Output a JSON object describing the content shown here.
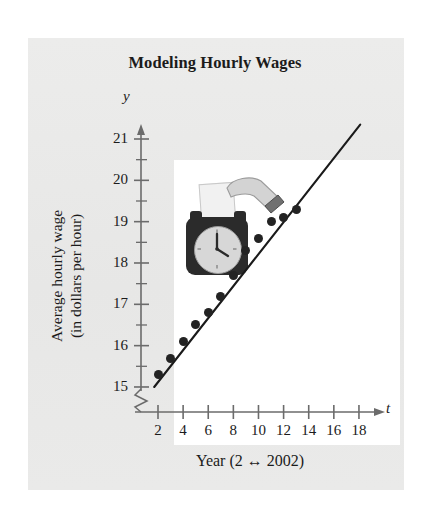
{
  "chart_data": {
    "type": "scatter",
    "title": "Modeling Hourly Wages",
    "xlabel": "Year (2 ↔ 2002)",
    "ylabel_line1": "Average hourly wage",
    "ylabel_line2": "(in dollars per hour)",
    "x_axis_variable": "t",
    "y_axis_variable": "y",
    "x_tick_labels": [
      "2",
      "4",
      "6",
      "8",
      "10",
      "12",
      "14",
      "16",
      "18"
    ],
    "x_tick_values": [
      2,
      4,
      6,
      8,
      10,
      12,
      14,
      16,
      18
    ],
    "y_tick_labels": [
      "15",
      "16",
      "17",
      "18",
      "19",
      "20",
      "21"
    ],
    "y_tick_values": [
      15,
      16,
      17,
      18,
      19,
      20,
      21
    ],
    "y_minor_tick_values": [
      15.5,
      16.5,
      17.5,
      18.5,
      19.5,
      20.5
    ],
    "xlim": [
      1,
      19
    ],
    "ylim": [
      15,
      21.3
    ],
    "grid": false,
    "legend": false,
    "y_axis_break": true,
    "x": [
      2,
      3,
      4,
      5,
      6,
      7,
      8,
      9,
      10,
      11,
      12,
      13
    ],
    "y": [
      15.3,
      15.7,
      16.1,
      16.5,
      16.8,
      17.2,
      17.7,
      18.3,
      18.6,
      19.0,
      19.1,
      19.3
    ],
    "series": [
      {
        "name": "Average hourly wage",
        "marker": "filled-circle",
        "color": "#232323",
        "points": [
          {
            "t": 2,
            "y": 15.3
          },
          {
            "t": 3,
            "y": 15.7
          },
          {
            "t": 4,
            "y": 16.1
          },
          {
            "t": 5,
            "y": 16.5
          },
          {
            "t": 6,
            "y": 16.8
          },
          {
            "t": 7,
            "y": 17.2
          },
          {
            "t": 8,
            "y": 17.7
          },
          {
            "t": 9,
            "y": 18.3
          },
          {
            "t": 10,
            "y": 18.6
          },
          {
            "t": 11,
            "y": 19.0
          },
          {
            "t": 12,
            "y": 19.1
          },
          {
            "t": 13,
            "y": 19.3
          }
        ]
      },
      {
        "name": "Linear regression model",
        "type": "line",
        "color": "#1a1a1a",
        "t_start": 1.7,
        "t_end": 18.1,
        "y_start": 15.0,
        "y_end": 21.35
      }
    ],
    "clipart": "time-clock-with-timecard"
  },
  "colors": {
    "page_background": "#ffffff",
    "panel_background": "#e9e9e8",
    "plot_background": "#ffffff",
    "ink": "#1b1b1b",
    "axis": "#6b6b6b",
    "marker": "#232323"
  }
}
